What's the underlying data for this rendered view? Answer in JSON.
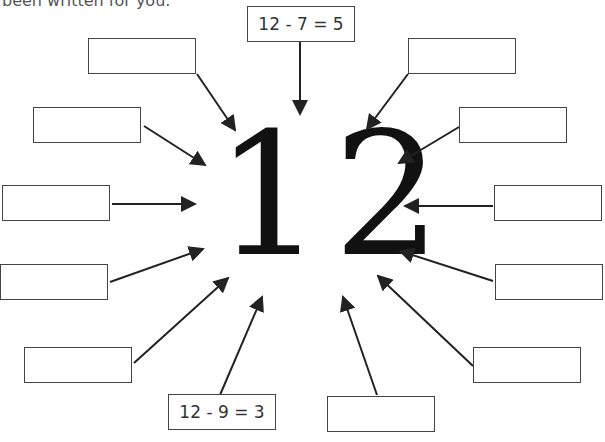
{
  "instruction_fragment": "been written for you.",
  "center_number": "12",
  "boxes": [
    {
      "id": "top",
      "text": "12 - 7 = 5"
    },
    {
      "id": "upper-left-1",
      "text": ""
    },
    {
      "id": "upper-left-2",
      "text": ""
    },
    {
      "id": "left-1",
      "text": ""
    },
    {
      "id": "left-2",
      "text": ""
    },
    {
      "id": "lower-left",
      "text": ""
    },
    {
      "id": "bottom-left",
      "text": "12 - 9 = 3"
    },
    {
      "id": "bottom-right",
      "text": ""
    },
    {
      "id": "lower-right",
      "text": ""
    },
    {
      "id": "right-2",
      "text": ""
    },
    {
      "id": "right-1",
      "text": ""
    },
    {
      "id": "upper-right-2",
      "text": ""
    },
    {
      "id": "upper-right-1",
      "text": ""
    }
  ]
}
